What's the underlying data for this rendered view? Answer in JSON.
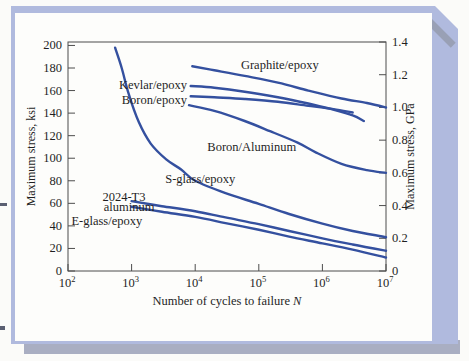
{
  "frame": {
    "panel_color": "#b0bade",
    "shadow_color": "#a9aec2",
    "bevel_color": "#99a0b5",
    "chart_background": "#fdfdfb",
    "page_background": "#fbfbf9"
  },
  "chart_data": {
    "type": "line",
    "title": "",
    "x_axis": {
      "label_prefix": "Number of cycles to failure ",
      "label_var": "N",
      "scale": "log",
      "tick_base": "10",
      "tick_exponents": [
        2,
        3,
        4,
        5,
        6,
        7
      ],
      "xlim_log": [
        2,
        7
      ],
      "grid": false
    },
    "y_left": {
      "label": "Maximum stress, ksi",
      "min": 0,
      "max": 200,
      "tick_step": 20
    },
    "y_right": {
      "label": "Maximum stress, GPa",
      "ticks": [
        "0",
        "0.2",
        "0.4",
        "0.6",
        "0.8",
        "1.0",
        "1.2",
        "1.4"
      ],
      "axis_top_gpa": 1.4,
      "ksi_per_gpa": 145.04
    },
    "style": {
      "line_color": "#34509f",
      "axis_color": "#4d4d4d",
      "text_color": "#1f1f1f",
      "line_width": 2.4
    },
    "legend_position": "inline-annotations",
    "series": [
      {
        "name": "Graphite/epoxy",
        "points": [
          [
            9000,
            181.5
          ],
          [
            20000,
            178
          ],
          [
            60000,
            173
          ],
          [
            200000,
            167
          ],
          [
            600000,
            160
          ],
          [
            2000000,
            153
          ],
          [
            5000000,
            149
          ],
          [
            10000000,
            145
          ]
        ]
      },
      {
        "name": "Kevlar/epoxy",
        "points": [
          [
            8500,
            164
          ],
          [
            20000,
            162.5
          ],
          [
            60000,
            159
          ],
          [
            200000,
            154
          ],
          [
            600000,
            148.5
          ],
          [
            1500000,
            143
          ],
          [
            3000000,
            138
          ],
          [
            4500000,
            133
          ]
        ]
      },
      {
        "name": "Boron/epoxy",
        "points": [
          [
            8500,
            155
          ],
          [
            20000,
            154
          ],
          [
            60000,
            152.5
          ],
          [
            200000,
            150
          ],
          [
            600000,
            146.5
          ],
          [
            1500000,
            143.5
          ],
          [
            3000000,
            140.5
          ]
        ]
      },
      {
        "name": "Boron/Aluminum",
        "points": [
          [
            8000,
            147
          ],
          [
            20000,
            142
          ],
          [
            60000,
            133
          ],
          [
            150000,
            124
          ],
          [
            400000,
            114
          ],
          [
            800000,
            105
          ],
          [
            2000000,
            95
          ],
          [
            5000000,
            89.5
          ],
          [
            10000000,
            87
          ]
        ]
      },
      {
        "name": "S-glass/epoxy",
        "points": [
          [
            550,
            198
          ],
          [
            700,
            180
          ],
          [
            900,
            157
          ],
          [
            1300,
            132
          ],
          [
            2000,
            113
          ],
          [
            3500,
            99
          ],
          [
            6000,
            90
          ],
          [
            10000,
            80
          ],
          [
            30000,
            69
          ],
          [
            100000,
            59.5
          ],
          [
            300000,
            50.5
          ],
          [
            1000000,
            42
          ],
          [
            3000000,
            35.5
          ],
          [
            10000000,
            30
          ]
        ]
      },
      {
        "name": "2024-T3 aluminum",
        "points": [
          [
            1000,
            62
          ],
          [
            3000,
            57.5
          ],
          [
            10000,
            53
          ],
          [
            30000,
            47.5
          ],
          [
            100000,
            41.5
          ],
          [
            300000,
            35.5
          ],
          [
            1000000,
            29
          ],
          [
            3000000,
            23.5
          ],
          [
            10000000,
            18
          ]
        ]
      },
      {
        "name": "E-glass/epoxy",
        "points": [
          [
            1000,
            57
          ],
          [
            3000,
            52.5
          ],
          [
            10000,
            48
          ],
          [
            30000,
            42.5
          ],
          [
            100000,
            36.5
          ],
          [
            300000,
            30.5
          ],
          [
            1000000,
            24.5
          ],
          [
            3000000,
            19
          ],
          [
            10000000,
            12
          ]
        ]
      }
    ],
    "annotations": [
      {
        "text": "Graphite/epoxy",
        "log_n": 5.33,
        "ksi": 183,
        "anchor": "middle"
      },
      {
        "text": "Kevlar/epoxy",
        "log_n": 3.87,
        "ksi": 164.5,
        "anchor": "end"
      },
      {
        "text": "Boron/epoxy",
        "log_n": 3.87,
        "ksi": 152,
        "anchor": "end"
      },
      {
        "text": "Boron/Aluminum",
        "log_n": 4.89,
        "ksi": 110,
        "anchor": "middle"
      },
      {
        "text": "S-glass/epoxy",
        "log_n": 4.08,
        "ksi": 82,
        "anchor": "middle"
      },
      {
        "text": "2024-T3",
        "log_n": 2.88,
        "ksi": 66,
        "anchor": "middle"
      },
      {
        "text": "aluminum",
        "log_n": 2.96,
        "ksi": 57,
        "anchor": "middle"
      },
      {
        "text": "E-glass/epoxy",
        "log_n": 2.61,
        "ksi": 44,
        "anchor": "middle"
      }
    ]
  }
}
